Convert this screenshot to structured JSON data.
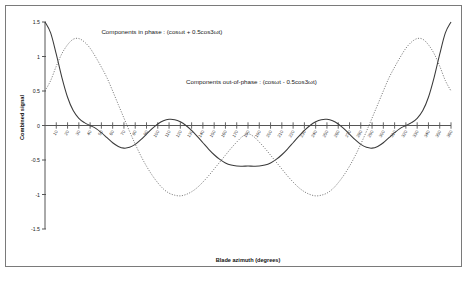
{
  "chart_data": {
    "type": "line",
    "title": "",
    "xlabel": "Blade azimuth (degrees)",
    "ylabel": "Combined signal",
    "xlim": [
      0,
      360
    ],
    "ylim": [
      -1.5,
      1.5
    ],
    "grid": false,
    "legend_position": "inline-annotation",
    "yticks": [
      "1.5",
      "1",
      "0.5",
      "0",
      "-0.5",
      "-1",
      "-1.5"
    ],
    "ytick_values": [
      1.5,
      1,
      0.5,
      0,
      -0.5,
      -1,
      -1.5
    ],
    "xticks": [
      "10",
      "20",
      "30",
      "40",
      "50",
      "60",
      "70",
      "80",
      "90",
      "100",
      "110",
      "120",
      "130",
      "140",
      "150",
      "160",
      "170",
      "180",
      "190",
      "200",
      "210",
      "220",
      "230",
      "240",
      "250",
      "260",
      "270",
      "280",
      "290",
      "300",
      "310",
      "320",
      "330",
      "340",
      "350",
      "360"
    ],
    "xtick_values": [
      10,
      20,
      30,
      40,
      50,
      60,
      70,
      80,
      90,
      100,
      110,
      120,
      130,
      140,
      150,
      160,
      170,
      180,
      190,
      200,
      210,
      220,
      230,
      240,
      250,
      260,
      270,
      280,
      290,
      300,
      310,
      320,
      330,
      340,
      350,
      360
    ],
    "annotations": [
      {
        "name": "in-phase-label",
        "text": "Components in phase : (cosωt + 0.5cos3ωt)",
        "x_deg": 50,
        "y_val": 1.33
      },
      {
        "name": "out-of-phase-label",
        "text": "Components out-of-phase : (cosωt - 0.5cos3ωt)",
        "x_deg": 125,
        "y_val": 0.6
      }
    ],
    "series": [
      {
        "name": "Components in phase",
        "formula": "cos(wt) + 0.5*cos(3wt)",
        "style": "solid",
        "color": "#3a3a3a",
        "x": [
          0,
          5,
          10,
          15,
          20,
          25,
          30,
          35,
          40,
          45,
          50,
          55,
          60,
          65,
          70,
          75,
          80,
          85,
          90,
          95,
          100,
          105,
          110,
          115,
          120,
          125,
          130,
          135,
          140,
          145,
          150,
          155,
          160,
          165,
          170,
          175,
          180,
          185,
          190,
          195,
          200,
          205,
          210,
          215,
          220,
          225,
          230,
          235,
          240,
          245,
          250,
          255,
          260,
          265,
          270,
          275,
          280,
          285,
          290,
          295,
          300,
          305,
          310,
          315,
          320,
          325,
          330,
          335,
          340,
          345,
          350,
          355,
          360
        ],
        "values": [
          1.5,
          1.342,
          1.034,
          0.695,
          0.41,
          0.216,
          0.104,
          0.041,
          0,
          -0.041,
          -0.104,
          -0.177,
          -0.25,
          -0.303,
          -0.328,
          -0.317,
          -0.274,
          -0.205,
          -0.125,
          -0.046,
          0.021,
          0.068,
          0.09,
          0.085,
          0.054,
          0,
          -0.072,
          -0.158,
          -0.25,
          -0.341,
          -0.424,
          -0.492,
          -0.543,
          -0.574,
          -0.588,
          -0.59,
          -0.588,
          -0.59,
          -0.588,
          -0.574,
          -0.543,
          -0.492,
          -0.424,
          -0.341,
          -0.25,
          -0.158,
          -0.072,
          0,
          0.054,
          0.085,
          0.09,
          0.068,
          0.021,
          -0.046,
          -0.125,
          -0.205,
          -0.274,
          -0.317,
          -0.328,
          -0.303,
          -0.25,
          -0.177,
          -0.104,
          -0.041,
          0,
          0.041,
          0.104,
          0.216,
          0.41,
          0.695,
          1.034,
          1.342,
          1.5
        ]
      },
      {
        "name": "Components out-of-phase",
        "formula": "cos(wt) - 0.5*cos(3wt)",
        "style": "dotted",
        "color": "#6b6b6b",
        "x": [
          0,
          5,
          10,
          15,
          20,
          25,
          30,
          35,
          40,
          45,
          50,
          55,
          60,
          65,
          70,
          75,
          80,
          85,
          90,
          95,
          100,
          105,
          110,
          115,
          120,
          125,
          130,
          135,
          140,
          145,
          150,
          155,
          160,
          165,
          170,
          175,
          180,
          185,
          190,
          195,
          200,
          205,
          210,
          215,
          220,
          225,
          230,
          235,
          240,
          245,
          250,
          255,
          260,
          265,
          270,
          275,
          280,
          285,
          290,
          295,
          300,
          305,
          310,
          315,
          320,
          325,
          330,
          335,
          340,
          345,
          350,
          355,
          360
        ],
        "values": [
          0.5,
          0.651,
          0.86,
          1.042,
          1.17,
          1.25,
          1.26,
          1.21,
          1.12,
          0.99,
          0.846,
          0.69,
          0.5,
          0.303,
          0.108,
          -0.086,
          -0.27,
          -0.44,
          -0.59,
          -0.72,
          -0.83,
          -0.92,
          -0.98,
          -1.01,
          -1.02,
          -1.0,
          -0.96,
          -0.9,
          -0.82,
          -0.73,
          -0.63,
          -0.53,
          -0.43,
          -0.33,
          -0.24,
          -0.16,
          -0.12,
          -0.16,
          -0.24,
          -0.33,
          -0.43,
          -0.53,
          -0.63,
          -0.73,
          -0.82,
          -0.9,
          -0.96,
          -1.0,
          -1.02,
          -1.01,
          -0.98,
          -0.92,
          -0.83,
          -0.72,
          -0.59,
          -0.44,
          -0.27,
          -0.086,
          0.108,
          0.303,
          0.5,
          0.69,
          0.846,
          0.99,
          1.12,
          1.21,
          1.26,
          1.25,
          1.17,
          1.042,
          0.86,
          0.651,
          0.5
        ]
      }
    ]
  }
}
